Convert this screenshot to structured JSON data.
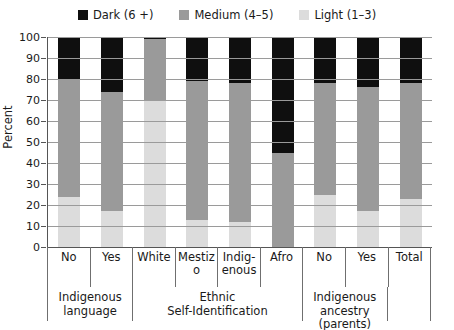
{
  "chart_data": {
    "type": "bar",
    "subtype": "stacked-bar-100",
    "title": "",
    "xlabel": "",
    "ylabel": "Percent",
    "ylim": [
      0,
      100
    ],
    "yticks": [
      0,
      10,
      20,
      30,
      40,
      50,
      60,
      70,
      80,
      90,
      100
    ],
    "grid": true,
    "legend_position": "top-center",
    "categories": [
      "No",
      "Yes",
      "White",
      "Mestizo",
      "Indig-\nenous",
      "Afro",
      "No",
      "Yes",
      "Total"
    ],
    "series": [
      {
        "name": "Light (1–3)",
        "color": "#dcdcdc",
        "values": [
          24,
          17,
          70,
          13,
          12,
          0,
          25,
          17,
          23
        ]
      },
      {
        "name": "Medium (4–5)",
        "color": "#9a9a9a",
        "values": [
          56,
          57,
          29,
          66,
          66,
          45,
          53,
          59,
          55
        ]
      },
      {
        "name": "Dark (6 +)",
        "color": "#0f0f0f",
        "values": [
          20,
          26,
          1,
          21,
          22,
          55,
          22,
          24,
          22
        ]
      }
    ],
    "groups": [
      {
        "label": "Indigenous\nlanguage",
        "span": 2
      },
      {
        "label": "Ethnic\nSelf-Identification",
        "span": 4
      },
      {
        "label": "Indigenous\nancestry (parents)",
        "span": 2
      },
      {
        "label": "",
        "span": 1
      }
    ]
  },
  "legend": {
    "items": [
      {
        "label": "Dark (6 +)",
        "color": "#0f0f0f"
      },
      {
        "label": "Medium (4–5)",
        "color": "#9a9a9a"
      },
      {
        "label": "Light (1–3)",
        "color": "#dcdcdc"
      }
    ]
  },
  "axis": {
    "y_label": "Percent"
  }
}
